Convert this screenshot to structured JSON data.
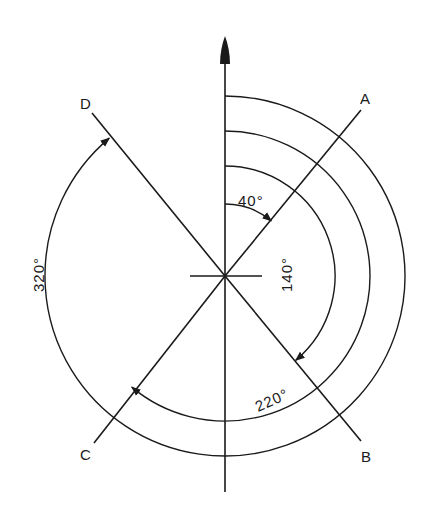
{
  "diagram": {
    "type": "azimuth-angles",
    "center": {
      "x": 225,
      "y": 276
    },
    "north_arrow": {
      "label": "",
      "direction": "up"
    },
    "lines": [
      {
        "id": "A",
        "label": "A",
        "azimuth_deg": 40
      },
      {
        "id": "B",
        "label": "B",
        "azimuth_deg": 140
      },
      {
        "id": "C",
        "label": "C",
        "azimuth_deg": 220
      },
      {
        "id": "D",
        "label": "D",
        "azimuth_deg": 320
      }
    ],
    "angle_labels": {
      "a40": "40°",
      "a140": "140°",
      "a220": "220°",
      "a320": "320°"
    },
    "colors": {
      "stroke": "#1a1a1a",
      "background": "#ffffff"
    }
  }
}
